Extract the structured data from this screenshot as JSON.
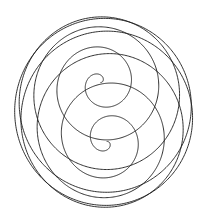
{
  "figure": {
    "background": "#ffffff",
    "stroke_color": "#1a1a1a",
    "stroke_width": 0.9
  },
  "spiral": {
    "center_x": 104,
    "center_y": 112,
    "radius": 96,
    "turns": 9,
    "tilt_deg": 72,
    "rotate_deg": -6,
    "x_scale": 0.93,
    "samples": 3000
  }
}
